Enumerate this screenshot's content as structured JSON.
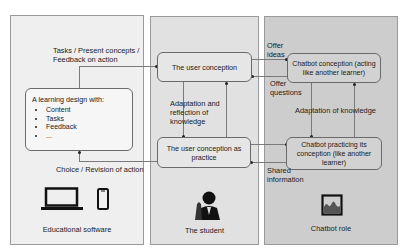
{
  "panels": {
    "left": {
      "caption": "Educational software",
      "bg": "#efefef"
    },
    "middle": {
      "caption": "The student",
      "bg": "#e1e1e1"
    },
    "right": {
      "caption": "Chatbot role",
      "bg": "#cdcdcd"
    }
  },
  "boxes": {
    "learning_design": {
      "title": "A learning design with:",
      "items": [
        "Content",
        "Tasks",
        "Feedback",
        "..."
      ]
    },
    "user_conception": "The user conception",
    "user_conception_practice": "The user conception as practice",
    "chatbot_conception": "Chatbot conception (acting like another learner)",
    "chatbot_practicing": "Chatbot practicing its conception (like another learner)"
  },
  "labels": {
    "tasks_present": "Tasks / Present concepts /",
    "feedback_on_action": "Feedback on action",
    "choice_revision": "Choice / Revision of action",
    "adaptation_reflection": [
      "Adaptation and",
      "reflection of",
      "knowledge"
    ],
    "offer_ideas": [
      "Offer",
      "ideas"
    ],
    "offer_questions": [
      "Offer",
      "questions"
    ],
    "adaptation_knowledge": "Adaptation of knowledge",
    "shared_information": [
      "Shared",
      "information"
    ]
  },
  "icons": {
    "left": [
      "laptop-icon",
      "smartphone-icon"
    ],
    "middle": "student-icon",
    "right": "image-frame-icon"
  }
}
